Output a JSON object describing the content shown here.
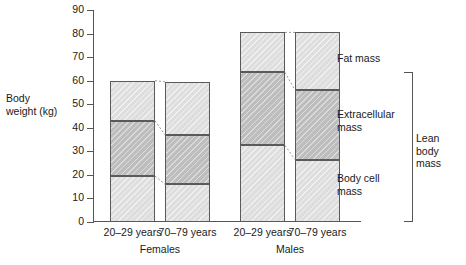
{
  "chart_data": {
    "type": "bar",
    "stacked": true,
    "title": "",
    "xlabel": "",
    "ylabel": "Body weight (kg)",
    "ylim": [
      0,
      90
    ],
    "ytick_step": 10,
    "yticks": [
      0,
      10,
      20,
      30,
      40,
      50,
      60,
      70,
      80,
      90
    ],
    "grid": false,
    "legend_position": "right-inline",
    "categories": [
      "20–29 years",
      "70–79 years",
      "20–29 years",
      "70–79 years"
    ],
    "groups": [
      {
        "name": "Females",
        "categories": [
          "20–29 years",
          "70–79 years"
        ]
      },
      {
        "name": "Males",
        "categories": [
          "20–29 years",
          "70–79 years"
        ]
      }
    ],
    "series": [
      {
        "name": "Body cell mass",
        "values": [
          19.5,
          16.0,
          32.5,
          26.5
        ]
      },
      {
        "name": "Extracellular mass",
        "values": [
          23.5,
          21.0,
          31.0,
          29.5
        ]
      },
      {
        "name": "Fat mass",
        "values": [
          17.0,
          22.5,
          17.0,
          24.5
        ]
      }
    ],
    "cumulative_boundaries": [
      {
        "category": "Females 20–29 years",
        "body_cell_top": 19.5,
        "extracellular_top": 43.0,
        "total": 60.0
      },
      {
        "category": "Females 70–79 years",
        "body_cell_top": 16.0,
        "extracellular_top": 37.0,
        "total": 59.5
      },
      {
        "category": "Males 20–29 years",
        "body_cell_top": 32.5,
        "extracellular_top": 63.5,
        "total": 80.5
      },
      {
        "category": "Males 70–79 years",
        "body_cell_top": 26.5,
        "extracellular_top": 56.0,
        "total": 80.5
      }
    ],
    "annotations": [
      {
        "text": "Fat mass",
        "position": "right"
      },
      {
        "text": "Extracellular mass",
        "position": "right"
      },
      {
        "text": "Body cell mass",
        "position": "right"
      },
      {
        "text": "Lean body mass",
        "position": "far-right",
        "bracket": true,
        "spans": [
          "Extracellular mass",
          "Body cell mass"
        ]
      }
    ],
    "colors": {
      "fat_mass": "#dedede",
      "extracellular_mass": "#bdbdbd",
      "body_cell_mass": "#dedede",
      "outline": "#5a5a5a",
      "axis": "#555555",
      "text": "#1a1a1a"
    }
  },
  "axis": {
    "y_label_line1": "Body",
    "y_label_line2": "weight (kg)",
    "y_tick_labels": [
      "90",
      "80",
      "70",
      "60",
      "50",
      "40",
      "30",
      "20",
      "10",
      "0"
    ]
  },
  "x_axis": {
    "age_labels": [
      "20–29 years",
      "70–79 years",
      "20–29 years",
      "70–79 years"
    ],
    "group_labels": [
      "Females",
      "Males"
    ]
  },
  "labels": {
    "fat_mass": "Fat mass",
    "extracellular_mass_line1": "Extracellular",
    "extracellular_mass_line2": "mass",
    "body_cell_mass_line1": "Body cell",
    "body_cell_mass_line2": "mass",
    "lean_body_mass_line1": "Lean body",
    "lean_body_mass_line2": "mass"
  }
}
